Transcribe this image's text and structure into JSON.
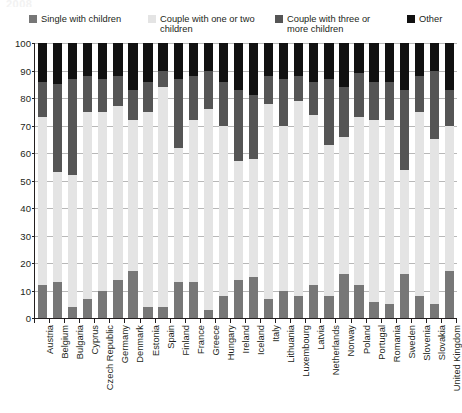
{
  "title_fragment": "2008",
  "legend": {
    "items": [
      {
        "label": "Single with children",
        "color": "#777777",
        "name": "single-with-children"
      },
      {
        "label": "Couple with one or two children",
        "color": "#e4e4e4",
        "name": "couple-one-or-two-children"
      },
      {
        "label": "Couple with three or more children",
        "color": "#555555",
        "name": "couple-three-or-more-children"
      },
      {
        "label": "Other",
        "color": "#111111",
        "name": "other"
      }
    ]
  },
  "axis": {
    "y_ticks": [
      "0",
      "10",
      "20",
      "30",
      "40",
      "50",
      "60",
      "70",
      "80",
      "90",
      "100"
    ],
    "y_min": 0,
    "y_max": 100,
    "y_step": 10
  },
  "chart_data": {
    "type": "bar",
    "subtype": "stacked-bar-100-percent",
    "title": "2008",
    "xlabel": "",
    "ylabel": "",
    "ylim": [
      0,
      100
    ],
    "grid": true,
    "legend_position": "top",
    "categories": [
      "Austria",
      "Belgium",
      "Bulgaria",
      "Cyprus",
      "Czech Republic",
      "Germany",
      "Denmark",
      "Estonia",
      "Spain",
      "Finland",
      "France",
      "Greece",
      "Hungary",
      "Ireland",
      "Iceland",
      "Italy",
      "Lithuania",
      "Luxembourg",
      "Latvia",
      "Netherlands",
      "Norway",
      "Poland",
      "Portugal",
      "Romania",
      "Sweden",
      "Slovenia",
      "Slovakia",
      "United Kingdom"
    ],
    "series": [
      {
        "name": "Single with children",
        "color": "#777777",
        "values": [
          12,
          13,
          4,
          7,
          10,
          14,
          17,
          4,
          4,
          13,
          13,
          3,
          8,
          14,
          15,
          7,
          10,
          8,
          12,
          8,
          16,
          12,
          6,
          5,
          16,
          8,
          5,
          17
        ]
      },
      {
        "name": "Couple with one or two children",
        "color": "#e4e4e4",
        "values": [
          61,
          40,
          48,
          68,
          65,
          63,
          55,
          71,
          80,
          49,
          59,
          73,
          62,
          43,
          43,
          71,
          60,
          71,
          62,
          55,
          50,
          61,
          66,
          67,
          38,
          67,
          60,
          53
        ]
      },
      {
        "name": "Couple with three or more children",
        "color": "#555555",
        "values": [
          13,
          32,
          35,
          13,
          12,
          11,
          11,
          11,
          6,
          25,
          16,
          14,
          16,
          26,
          23,
          10,
          17,
          9,
          12,
          24,
          18,
          16,
          14,
          14,
          29,
          13,
          25,
          13
        ]
      },
      {
        "name": "Other",
        "color": "#111111",
        "values": [
          14,
          15,
          13,
          12,
          13,
          12,
          17,
          14,
          10,
          13,
          12,
          10,
          14,
          17,
          19,
          12,
          13,
          12,
          14,
          13,
          16,
          11,
          14,
          14,
          17,
          12,
          10,
          17
        ]
      }
    ],
    "stack_totals": [
      100,
      100,
      100,
      100,
      100,
      100,
      100,
      100,
      100,
      100,
      100,
      100,
      100,
      100,
      100,
      100,
      100,
      100,
      100,
      100,
      100,
      100,
      100,
      100,
      100,
      100,
      100,
      100
    ]
  }
}
